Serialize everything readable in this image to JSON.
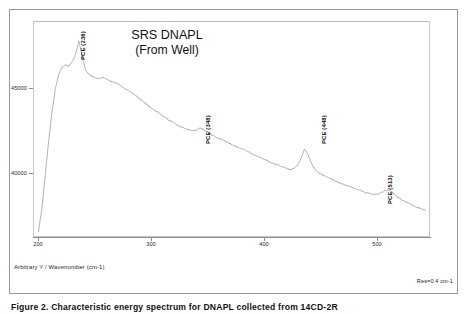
{
  "figure": {
    "caption_label": "Figure 2.",
    "caption_text": "Characteristic energy spectrum for DNAPL collected from 14CD-2R"
  },
  "chart_data": {
    "type": "line",
    "title": "SRS DNAPL",
    "subtitle": "(From Well)",
    "xlabel": "Wavenumber (cm-1)",
    "ylabel": "Arbitrary Y",
    "axis_caption": "Arbitrary Y / Wavenumber (cm-1)",
    "resolution_note": "Res=0.4 cm-1",
    "xlim": [
      196,
      548
    ],
    "ylim": [
      37400,
      47600
    ],
    "grid": false,
    "legend": "none",
    "xticks": [
      200,
      300,
      400,
      500
    ],
    "xtick_labels": [
      "200",
      "300",
      "400",
      "500"
    ],
    "yticks": [
      40000,
      45000
    ],
    "ytick_labels": [
      "40000",
      "45000"
    ],
    "line_color": "#8e8e8e",
    "annotations": [
      {
        "label": "PCE (236)",
        "x": 236,
        "y": 46550
      },
      {
        "label": "PCE (348)",
        "x": 348,
        "y": 42450
      },
      {
        "label": "PCE (448)",
        "x": 448,
        "y": 41950
      },
      {
        "label": "PCE (513)",
        "x": 513,
        "y": 39400
      }
    ],
    "x": [
      200,
      203,
      206,
      209,
      212,
      215,
      218,
      221,
      224,
      227,
      230,
      233,
      236,
      239,
      242,
      245,
      248,
      251,
      254,
      257,
      260,
      263,
      266,
      269,
      272,
      275,
      278,
      281,
      284,
      287,
      290,
      293,
      296,
      299,
      302,
      305,
      308,
      311,
      314,
      317,
      320,
      323,
      326,
      329,
      332,
      335,
      338,
      341,
      344,
      347,
      350,
      353,
      356,
      359,
      362,
      365,
      368,
      371,
      374,
      377,
      380,
      383,
      386,
      389,
      392,
      395,
      398,
      401,
      404,
      407,
      410,
      413,
      416,
      419,
      422,
      425,
      428,
      431,
      434,
      437,
      440,
      443,
      446,
      449,
      452,
      455,
      458,
      461,
      464,
      467,
      470,
      473,
      476,
      479,
      482,
      485,
      488,
      491,
      494,
      497,
      500,
      503,
      506,
      509,
      512,
      515,
      518,
      521,
      524,
      527,
      530,
      533,
      536,
      539,
      542,
      545
    ],
    "y": [
      37600,
      38700,
      40300,
      41900,
      43300,
      44400,
      45100,
      45450,
      45550,
      45500,
      45700,
      46050,
      46700,
      45950,
      45300,
      45100,
      45000,
      44950,
      44900,
      44980,
      44900,
      44820,
      44750,
      44700,
      44620,
      44500,
      44400,
      44300,
      44200,
      44080,
      43950,
      43820,
      43700,
      43560,
      43440,
      43350,
      43240,
      43120,
      43000,
      42900,
      42800,
      42700,
      42620,
      42560,
      42500,
      42440,
      42420,
      42460,
      42540,
      42480,
      42380,
      42280,
      42180,
      42100,
      42020,
      41960,
      41880,
      41800,
      41720,
      41650,
      41580,
      41520,
      41440,
      41360,
      41280,
      41200,
      41130,
      41060,
      40980,
      40900,
      40840,
      40780,
      40720,
      40660,
      40600,
      40560,
      40620,
      40780,
      41100,
      41550,
      41300,
      40880,
      40600,
      40450,
      40350,
      40280,
      40200,
      40120,
      40040,
      39960,
      39900,
      39840,
      39780,
      39720,
      39660,
      39600,
      39540,
      39480,
      39440,
      39400,
      39380,
      39400,
      39480,
      39560,
      39620,
      39480,
      39340,
      39220,
      39120,
      39040,
      38960,
      38880,
      38800,
      38740,
      38680,
      38620
    ]
  }
}
